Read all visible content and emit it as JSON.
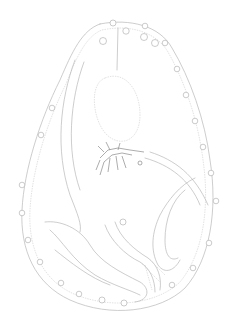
{
  "image": {
    "kind": "scientific line illustration",
    "subject": "oval specimen outline with beaded border and internal tubular structures",
    "colors": {
      "background": "#ffffff",
      "line": "#b8b8b8",
      "dark_detail": "#8a8a8a"
    }
  }
}
